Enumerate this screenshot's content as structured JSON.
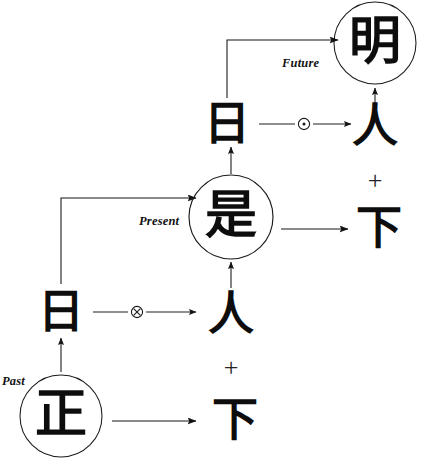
{
  "diagram": {
    "background_color": "#ffffff",
    "ink_color": "#0d0d0d",
    "width": 431,
    "height": 465,
    "era_labels": {
      "past": "Past",
      "present": "Present",
      "future": "Future"
    },
    "nodes": {
      "past_circled": {
        "char": "正",
        "label": "zheng-correct"
      },
      "past_row_result": {
        "char": "下",
        "label": "xia-below"
      },
      "past_plus": {
        "char": "+"
      },
      "middle_left": {
        "char": "日",
        "label": "ri-sun"
      },
      "middle_right": {
        "char": "人",
        "label": "ren-person"
      },
      "present_circled": {
        "char": "是",
        "label": "shi-is"
      },
      "present_row_result": {
        "char": "下",
        "label": "xia-below"
      },
      "present_plus": {
        "char": "+"
      },
      "upper_left": {
        "char": "日",
        "label": "ri-sun"
      },
      "upper_right": {
        "char": "人",
        "label": "ren-person"
      },
      "future_circled": {
        "char": "明",
        "label": "ming-bright"
      }
    },
    "operators": {
      "lower": {
        "symbol": "⊗",
        "name": "circled-times"
      },
      "upper": {
        "symbol": "⊙",
        "name": "circled-dot"
      }
    }
  }
}
